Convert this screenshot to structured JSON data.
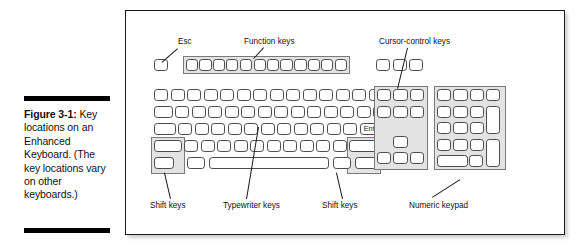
{
  "caption": {
    "figure_label": "Figure 3-1:",
    "text": " Key locations on an Enhanced Keyboard. (The key locations vary on other keyboards.)"
  },
  "figure": {
    "annotations": {
      "esc": "Esc",
      "function_keys": "Function keys",
      "cursor_control_keys": "Cursor-control keys",
      "shift_keys_left": "Shift keys",
      "typewriter_keys": "Typewriter keys",
      "shift_keys_right": "Shift keys",
      "numeric_keypad": "Numeric keypad"
    },
    "key_labels": {
      "enter": "Enter"
    }
  },
  "colors": {
    "frame_border": "#1a1a1a",
    "key_outline": "#4c4c4c",
    "group_shade": "#e3e3e3",
    "text": "#111111",
    "page_background": "#ffffff"
  }
}
